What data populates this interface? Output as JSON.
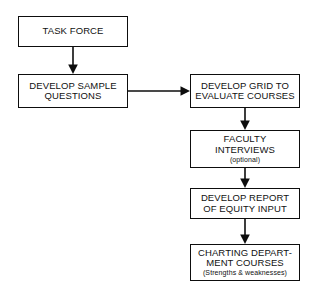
{
  "diagram": {
    "background_color": "#ffffff",
    "line_color": "#0d0d0d",
    "nodes": [
      {
        "id": "task_force",
        "label": "TASK FORCE",
        "sub": ""
      },
      {
        "id": "develop_sample",
        "label": "DEVELOP SAMPLE\nQUESTIONS",
        "sub": ""
      },
      {
        "id": "develop_grid",
        "label": "DEVELOP GRID TO\nEVALUATE COURSES",
        "sub": ""
      },
      {
        "id": "faculty",
        "label": "FACULTY\nINTERVIEWS",
        "sub": "(optional)"
      },
      {
        "id": "develop_report",
        "label": "DEVELOP REPORT\nOF EQUITY INPUT",
        "sub": ""
      },
      {
        "id": "charting",
        "label": "CHARTING DEPART-\nMENT COURSES",
        "sub": "(Strengths & weaknesses)"
      }
    ],
    "edges": [
      {
        "from": "task_force",
        "to": "develop_sample",
        "direction": "down"
      },
      {
        "from": "develop_sample",
        "to": "develop_grid",
        "direction": "right"
      },
      {
        "from": "develop_grid",
        "to": "faculty",
        "direction": "down"
      },
      {
        "from": "faculty",
        "to": "develop_report",
        "direction": "down"
      },
      {
        "from": "develop_report",
        "to": "charting",
        "direction": "down"
      }
    ]
  }
}
